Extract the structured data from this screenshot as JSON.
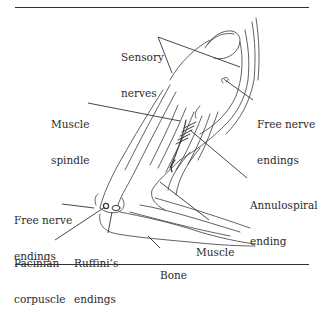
{
  "figure": {
    "labels": {
      "sensory_nerves": {
        "line1": "Sensory",
        "line2": "nerves"
      },
      "muscle_spindle": {
        "line1": "Muscle",
        "line2": "spindle"
      },
      "free_nerve_endings_upper": {
        "line1": "Free nerve",
        "line2": "endings"
      },
      "annulospiral_ending": {
        "line1": "Annulospiral",
        "line2": "ending"
      },
      "free_nerve_endings_lower": {
        "line1": "Free nerve",
        "line2": "endings"
      },
      "muscle": {
        "line1": "Muscle"
      },
      "pacinian_corpuscle": {
        "line1": "Pacinian",
        "line2": "corpuscle"
      },
      "ruffinis_endings": {
        "line1": "Ruffini’s",
        "line2": "endings"
      },
      "bone": {
        "line1": "Bone"
      }
    },
    "colors": {
      "ink": "#2a2a2a",
      "background": "#ffffff"
    }
  }
}
